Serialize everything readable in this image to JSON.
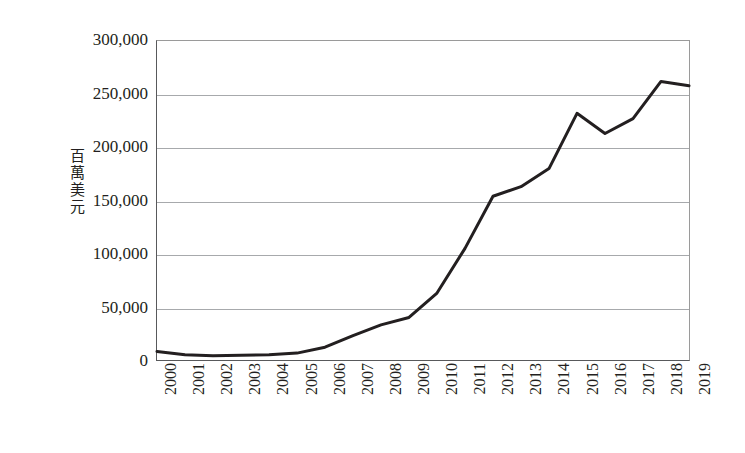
{
  "chart_data": {
    "type": "line",
    "title": "",
    "subtitle": "",
    "xlabel": "",
    "ylabel": "百萬美元",
    "ylabel_chars": [
      "百",
      "萬",
      "美",
      "元"
    ],
    "categories": [
      "2000",
      "2001",
      "2002",
      "2003",
      "2004",
      "2005",
      "2006",
      "2007",
      "2008",
      "2009",
      "2010",
      "2011",
      "2012",
      "2013",
      "2014",
      "2015",
      "2016",
      "2017",
      "2018",
      "2019"
    ],
    "values": [
      8000,
      5000,
      4000,
      4500,
      5000,
      6500,
      12000,
      23000,
      33000,
      40000,
      63000,
      105000,
      154000,
      163000,
      180000,
      232000,
      213000,
      227000,
      262000,
      258000
    ],
    "series": [
      {
        "name": "百萬美元",
        "values": [
          8000,
          5000,
          4000,
          4500,
          5000,
          6500,
          12000,
          23000,
          33000,
          40000,
          63000,
          105000,
          154000,
          163000,
          180000,
          232000,
          213000,
          227000,
          262000,
          258000
        ]
      }
    ],
    "ylim": [
      0,
      300000
    ],
    "ytick_values": [
      0,
      50000,
      100000,
      150000,
      200000,
      250000,
      300000
    ],
    "ytick_labels": [
      "0",
      "50,000",
      "100,000",
      "150,000",
      "200,000",
      "250,000",
      "300,000"
    ],
    "grid": "horizontal",
    "legend": "none",
    "annotations": [],
    "colors": {
      "line": "#231f20",
      "gridline": "#a7a9ac",
      "axis": "#58595b",
      "plot_background": "#ffffff",
      "text": "#231f20"
    },
    "line_width_px": 3,
    "markers": "none"
  }
}
